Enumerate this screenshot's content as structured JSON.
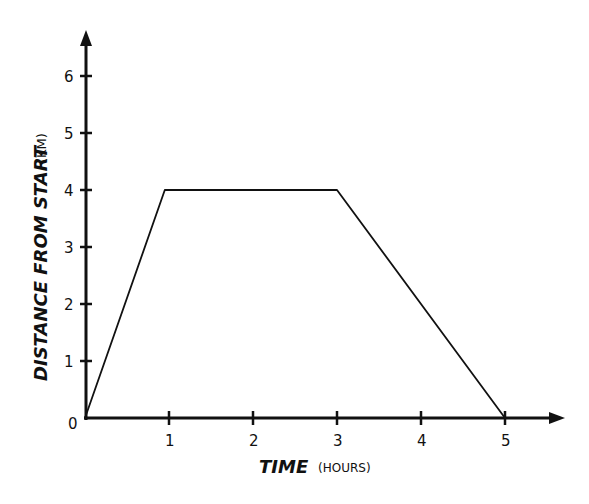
{
  "chart_data": {
    "type": "line",
    "title": "",
    "xlabel": "TIME",
    "xlabel_unit": "(HOURS)",
    "ylabel": "DISTANCE FROM START",
    "ylabel_unit": "(KM)",
    "x_ticks": [
      "1",
      "2",
      "3",
      "4",
      "5"
    ],
    "y_ticks": [
      "1",
      "2",
      "3",
      "4",
      "5",
      "6"
    ],
    "origin_label": "0",
    "xlim": [
      0,
      5.6
    ],
    "ylim": [
      0,
      6.8
    ],
    "grid": false,
    "legend": null,
    "series": [
      {
        "name": "distance",
        "x": [
          0,
          0.95,
          3,
          5
        ],
        "y": [
          0,
          4,
          4,
          0
        ]
      }
    ]
  }
}
